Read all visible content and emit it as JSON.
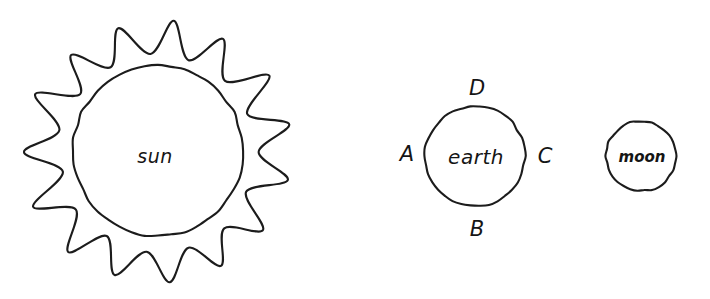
{
  "diagram": {
    "style": "hand-drawn line art",
    "background_color": "#ffffff",
    "stroke_color": "#1c1c1c",
    "bodies": [
      {
        "id": "sun",
        "label": "sun",
        "shape": "spiked-circle",
        "center_x": 158,
        "center_y": 152,
        "outer_radius": 133,
        "inner_radius": 85,
        "spike_count": 15
      },
      {
        "id": "earth",
        "label": "earth",
        "shape": "circle",
        "center_x": 475,
        "center_y": 156,
        "radius": 50
      },
      {
        "id": "moon",
        "label": "moon",
        "shape": "circle",
        "center_x": 641,
        "center_y": 156,
        "radius": 35
      }
    ],
    "point_labels": [
      {
        "id": "a",
        "label": "A",
        "position": "left-of-earth",
        "x": 407,
        "y": 154
      },
      {
        "id": "b",
        "label": "B",
        "position": "below-earth",
        "x": 477,
        "y": 229
      },
      {
        "id": "c",
        "label": "C",
        "position": "right-of-earth",
        "x": 545,
        "y": 156
      },
      {
        "id": "d",
        "label": "D",
        "position": "above-earth",
        "x": 477,
        "y": 88
      }
    ]
  }
}
